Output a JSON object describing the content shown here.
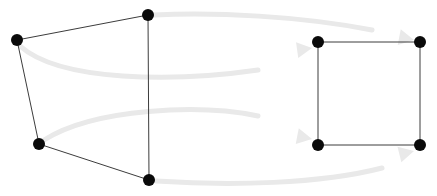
{
  "figure": {
    "type": "diagram",
    "subtype": "graph-mapping",
    "width": 437,
    "height": 196,
    "background_color": "#ffffff",
    "node_color": "#0a0a0a",
    "node_radius": 6,
    "edge_color": "#3c3c3c",
    "edge_width": 1,
    "mapping_arrow_color": "#e9e9e9",
    "mapping_arrow_width": 5
  },
  "graphs": [
    {
      "id": "source-graph",
      "name": "left-graph",
      "nodes": [
        {
          "id": "L1",
          "label": "",
          "x": 17,
          "y": 40
        },
        {
          "id": "L2",
          "label": "",
          "x": 148,
          "y": 15
        },
        {
          "id": "L3",
          "label": "",
          "x": 39,
          "y": 144
        },
        {
          "id": "L4",
          "label": "",
          "x": 149,
          "y": 180
        }
      ],
      "edges": [
        {
          "from": "L1",
          "to": "L2"
        },
        {
          "from": "L1",
          "to": "L3"
        },
        {
          "from": "L2",
          "to": "L4"
        },
        {
          "from": "L3",
          "to": "L4"
        }
      ]
    },
    {
      "id": "target-graph",
      "name": "right-graph",
      "nodes": [
        {
          "id": "R1",
          "label": "",
          "x": 318,
          "y": 42
        },
        {
          "id": "R2",
          "label": "",
          "x": 420,
          "y": 42
        },
        {
          "id": "R3",
          "label": "",
          "x": 318,
          "y": 145
        },
        {
          "id": "R4",
          "label": "",
          "x": 420,
          "y": 145
        }
      ],
      "edges": [
        {
          "from": "R1",
          "to": "R2"
        },
        {
          "from": "R1",
          "to": "R3"
        },
        {
          "from": "R2",
          "to": "R4"
        },
        {
          "from": "R3",
          "to": "R4"
        }
      ]
    }
  ],
  "mappings": [
    {
      "id": "map-1",
      "name": "mapping-L2-to-R2",
      "from": "L2",
      "to": "R2",
      "path": "M 154 15 C 215 12, 300 16, 372 30",
      "arrowhead_at": {
        "x": 414,
        "y": 40
      }
    },
    {
      "id": "map-2",
      "name": "mapping-L1-to-R1",
      "from": "L1",
      "to": "R1",
      "path": "M 20 46 C 60 82, 175 82, 258 70",
      "arrowhead_at": {
        "x": 312,
        "y": 48
      }
    },
    {
      "id": "map-3",
      "name": "mapping-L3-to-R3",
      "from": "L3",
      "to": "R3",
      "path": "M 44 140 C 95 108, 200 104, 258 116",
      "arrowhead_at": {
        "x": 312,
        "y": 139
      }
    },
    {
      "id": "map-4",
      "name": "mapping-L4-to-R4",
      "from": "L4",
      "to": "R4",
      "path": "M 156 181 C 230 186, 320 184, 382 168",
      "arrowhead_at": {
        "x": 414,
        "y": 151
      }
    }
  ]
}
